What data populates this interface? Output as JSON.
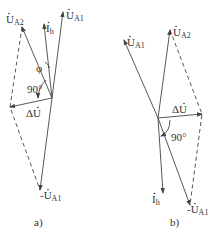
{
  "diagram_a": {
    "caption": "a)",
    "labels": {
      "ua1": {
        "main": "U",
        "sub": "A1"
      },
      "ua2": {
        "main": "U",
        "sub": "A2"
      },
      "ih": {
        "main": "I",
        "sub": "h"
      },
      "du": {
        "main": "ΔU"
      },
      "neg_ua1": {
        "main": "-U",
        "sub": "A1"
      },
      "phi": "φ",
      "angle": "90°"
    }
  },
  "diagram_b": {
    "caption": "b)",
    "labels": {
      "ua1": {
        "main": "U",
        "sub": "A1"
      },
      "ua2": {
        "main": "U",
        "sub": "A2"
      },
      "ih": {
        "main": "I",
        "sub": "h"
      },
      "du": {
        "main": "ΔU"
      },
      "neg_ua1": {
        "main": "-U",
        "sub": "A1"
      },
      "angle": "90°"
    }
  },
  "colors": {
    "line": "#444444",
    "text": "#333333"
  }
}
